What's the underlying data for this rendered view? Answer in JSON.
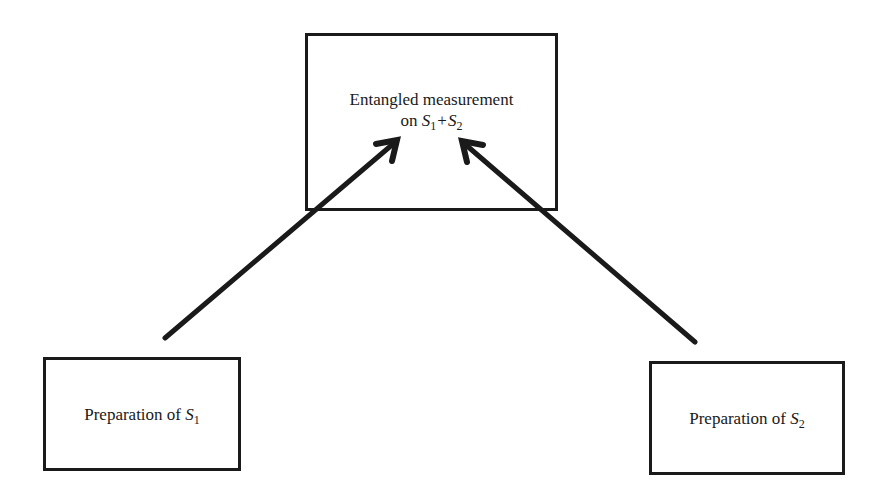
{
  "diagram": {
    "nodes": {
      "measurement": {
        "line1": "Entangled measurement",
        "line2_prefix": "on",
        "sys1_symbol": "S",
        "sys1_sub": "1",
        "plus": "+",
        "sys2_symbol": "S",
        "sys2_sub": "2"
      },
      "prep1": {
        "prefix": "Preparation of",
        "symbol": "S",
        "sub": "1"
      },
      "prep2": {
        "prefix": "Preparation of",
        "symbol": "S",
        "sub": "2"
      }
    },
    "edges": [
      {
        "from": "prep1",
        "to": "measurement",
        "label": ""
      },
      {
        "from": "prep2",
        "to": "measurement",
        "label": ""
      }
    ],
    "colors": {
      "stroke": "#1a1a1a",
      "background": "#ffffff"
    }
  }
}
